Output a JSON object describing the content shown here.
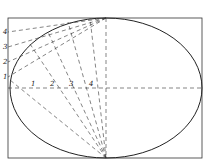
{
  "diagram": {
    "colors": {
      "stroke": "#222222",
      "dash": "#333333",
      "background": "#ffffff"
    },
    "rectangle": {
      "x": 8,
      "y": 18,
      "w": 194,
      "h": 140
    },
    "ellipse": {
      "cx": 106,
      "cy": 88,
      "rx": 96,
      "ry": 70
    },
    "left_labels": [
      {
        "text": "1",
        "x": 3,
        "y": 79
      },
      {
        "text": "2",
        "x": 3,
        "y": 64
      },
      {
        "text": "3",
        "x": 3,
        "y": 49
      },
      {
        "text": "4",
        "x": 3,
        "y": 34
      }
    ],
    "axis_labels": [
      {
        "text": "1",
        "x": 31,
        "y": 86
      },
      {
        "text": "2",
        "x": 50,
        "y": 86
      },
      {
        "text": "3",
        "x": 69,
        "y": 86
      },
      {
        "text": "4",
        "x": 89,
        "y": 86
      }
    ]
  }
}
